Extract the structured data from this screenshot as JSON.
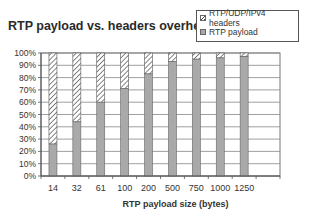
{
  "chart_data": {
    "type": "bar",
    "stacked": true,
    "percent_stacked": true,
    "title": "RTP payload vs. headers overhead",
    "xlabel": "RTP payload size (bytes)",
    "ylabel": "",
    "categories": [
      "14",
      "32",
      "61",
      "100",
      "200",
      "500",
      "750",
      "1000",
      "1250"
    ],
    "series": [
      {
        "name": "RTP payload",
        "pattern": "solid-gray",
        "values": [
          26,
          44,
          60,
          71,
          83,
          93,
          95,
          96,
          97
        ]
      },
      {
        "name": "RTP/UDP/IPv4 headers",
        "pattern": "diagonal-hatch",
        "values": [
          74,
          56,
          40,
          29,
          17,
          7,
          5,
          4,
          3
        ]
      }
    ],
    "yticks": [
      "0%",
      "10%",
      "20%",
      "30%",
      "40%",
      "50%",
      "60%",
      "70%",
      "80%",
      "90%",
      "100%"
    ],
    "ylim": [
      0,
      100
    ],
    "grid": true,
    "legend_position": "top-right",
    "legend": [
      "RTP/UDP/IPv4 headers",
      "RTP payload"
    ]
  },
  "title": "RTP payload vs. headers overhead",
  "legend": {
    "headers_label": "RTP/UDP/IPv4 headers",
    "payload_label": "RTP payload"
  },
  "xlabel": "RTP payload size (bytes)"
}
